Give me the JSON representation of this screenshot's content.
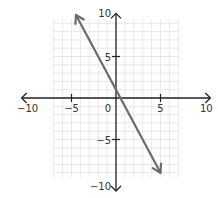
{
  "chart_data": {
    "type": "line",
    "title": "",
    "xlabel": "",
    "ylabel": "",
    "xlim": [
      -10,
      10
    ],
    "ylim": [
      -10,
      10
    ],
    "grid": true,
    "x_ticks": [
      -10,
      -5,
      0,
      5,
      10
    ],
    "y_ticks": [
      -10,
      -5,
      5,
      10
    ],
    "x_tick_labels": [
      "−10",
      "−5",
      "0",
      "5",
      "10"
    ],
    "y_tick_labels": [
      "−10",
      "−5",
      "5",
      "10"
    ],
    "series": [
      {
        "name": "line",
        "equation": "y = -2x + 1",
        "x": [
          -4.5,
          5
        ],
        "y": [
          10,
          -9
        ],
        "arrows": "both",
        "color": "#6b6b6b"
      }
    ]
  },
  "colors": {
    "axis": "#222222",
    "grid": "#e2e2e2",
    "line": "#6b6b6b"
  }
}
